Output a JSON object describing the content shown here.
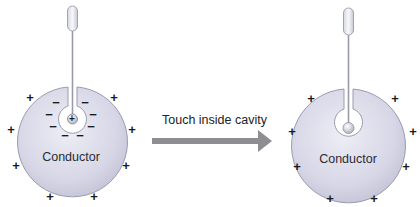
{
  "figure": {
    "left_panel": {
      "conductor_label": "Conductor",
      "outer_charges": "+",
      "inner_charges": "−",
      "probe_charge": "+",
      "state": "charged probe inside cavity induces negative charge on cavity wall"
    },
    "transition": {
      "arrow_label": "Touch inside cavity"
    },
    "right_panel": {
      "conductor_label": "Conductor",
      "outer_charges": "+",
      "state": "probe touched cavity wall; charge transferred to outer surface"
    },
    "colors": {
      "conductor_fill": "#d7d7e6",
      "conductor_edge": "#9b9bb0",
      "arrow": "#8e8e92",
      "text": "#2b2b33"
    }
  }
}
